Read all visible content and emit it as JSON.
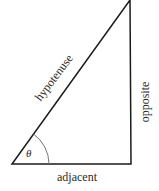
{
  "diagram": {
    "type": "right-triangle",
    "labels": {
      "hypotenuse": "hypotenuse",
      "opposite": "opposite",
      "adjacent": "adjacent",
      "angle": "θ"
    },
    "colors": {
      "stroke": "#1a1a1a",
      "arc": "#777777",
      "text": "#2a2a2a",
      "background": "#ffffff"
    }
  }
}
